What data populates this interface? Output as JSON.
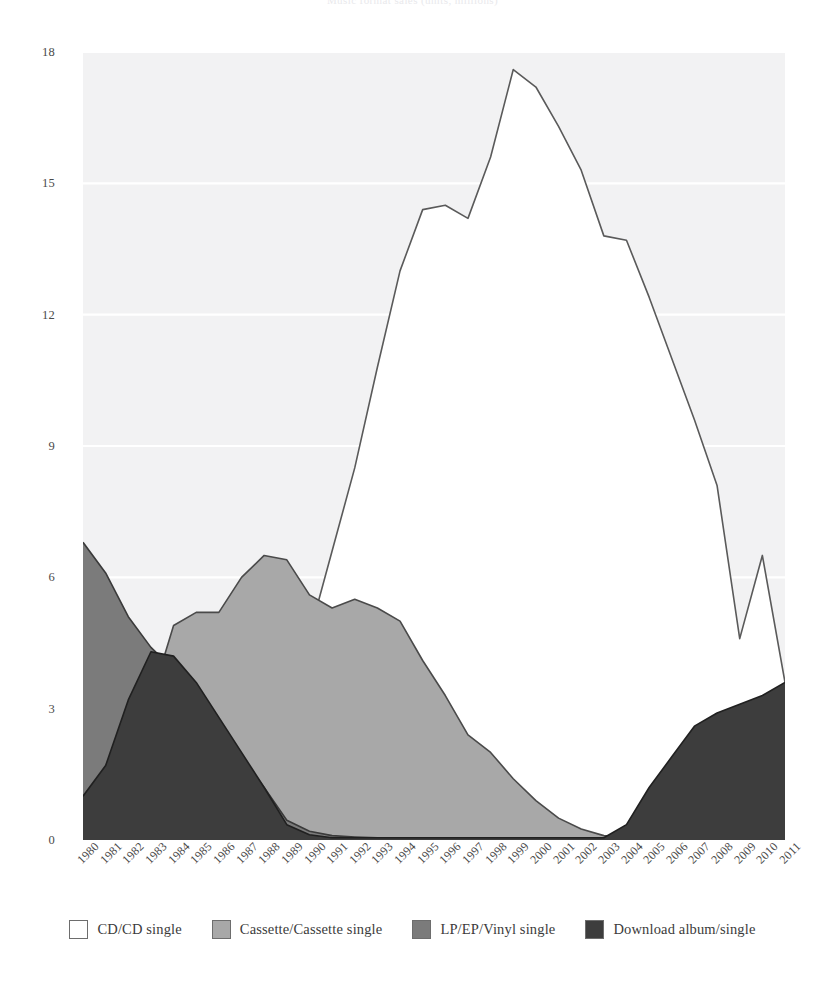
{
  "chart_data": {
    "type": "area",
    "title": "Music format sales (units, millions)",
    "xlabel": "",
    "ylabel": "",
    "ylim": [
      0,
      18
    ],
    "yticks": [
      0,
      3,
      6,
      9,
      12,
      15,
      18
    ],
    "grid": true,
    "legend_position": "bottom",
    "stacked": false,
    "categories": [
      "1980",
      "1981",
      "1982",
      "1983",
      "1984",
      "1985",
      "1986",
      "1987",
      "1988",
      "1989",
      "1990",
      "1991",
      "1992",
      "1993",
      "1994",
      "1995",
      "1996",
      "1997",
      "1998",
      "1999",
      "2000",
      "2001",
      "2002",
      "2003",
      "2004",
      "2005",
      "2006",
      "2007",
      "2008",
      "2009",
      "2010",
      "2011"
    ],
    "series": [
      {
        "name": "CD/CD single",
        "color": "#ffffff",
        "stroke": "#5a5a5a",
        "values": [
          0,
          0,
          0,
          0,
          0.1,
          0.3,
          0.8,
          1.6,
          2.6,
          3.6,
          4.7,
          6.6,
          8.5,
          10.8,
          13.0,
          14.4,
          14.5,
          14.2,
          15.6,
          17.6,
          17.2,
          16.3,
          15.3,
          13.8,
          13.7,
          12.4,
          11.0,
          9.6,
          8.1,
          4.6,
          6.5,
          3.6
        ]
      },
      {
        "name": "Cassette/Cassette single",
        "color": "#a8a8a8",
        "stroke": "#4a4a4a",
        "values": [
          0,
          1.0,
          1.9,
          3.2,
          4.9,
          5.2,
          5.2,
          6.0,
          6.5,
          6.4,
          5.6,
          5.3,
          5.5,
          5.3,
          5.0,
          4.1,
          3.3,
          2.4,
          2.0,
          1.4,
          0.9,
          0.5,
          0.25,
          0.1,
          0.05,
          0.02,
          0,
          0,
          0,
          0,
          0,
          0
        ]
      },
      {
        "name": "LP/EP/Vinyl single",
        "color": "#7b7b7b",
        "stroke": "#3a3a3a",
        "values": [
          6.8,
          6.1,
          5.1,
          4.4,
          3.9,
          3.3,
          2.6,
          1.9,
          1.2,
          0.45,
          0.2,
          0.1,
          0.07,
          0.05,
          0.04,
          0.03,
          0.03,
          0.02,
          0.02,
          0.02,
          0.02,
          0.02,
          0.02,
          0.02,
          0.02,
          0.02,
          0.02,
          0.03,
          0.05,
          0.08,
          0.12,
          0.2
        ]
      },
      {
        "name": "Download album/single",
        "color": "#3d3d3d",
        "stroke": "#202020",
        "values": [
          1.0,
          1.7,
          3.2,
          4.3,
          4.2,
          3.6,
          2.8,
          2.0,
          1.2,
          0.35,
          0.12,
          0.05,
          0.05,
          0.05,
          0.05,
          0.05,
          0.05,
          0.05,
          0.05,
          0.05,
          0.05,
          0.05,
          0.05,
          0.05,
          0.35,
          1.2,
          1.9,
          2.6,
          2.9,
          3.1,
          3.3,
          3.6
        ]
      }
    ]
  }
}
